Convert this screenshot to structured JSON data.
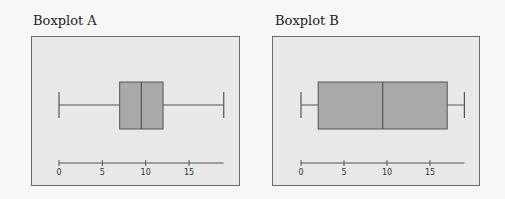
{
  "chart_data": [
    {
      "type": "boxplot",
      "title": "Boxplot A",
      "xlabel": "",
      "ylabel": "",
      "xlim": [
        0,
        19
      ],
      "ticks": [
        0,
        5,
        10,
        15
      ],
      "tick_labels": [
        "0",
        "5",
        "10",
        "15"
      ],
      "grid": false,
      "stats": {
        "min": 0,
        "q1": 7,
        "median": 9.5,
        "q3": 12,
        "max": 19
      }
    },
    {
      "type": "boxplot",
      "title": "Boxplot B",
      "xlabel": "",
      "ylabel": "",
      "xlim": [
        0,
        19
      ],
      "ticks": [
        0,
        5,
        10,
        15
      ],
      "tick_labels": [
        "0",
        "5",
        "10",
        "15"
      ],
      "grid": false,
      "stats": {
        "min": 0,
        "q1": 2,
        "median": 9.5,
        "q3": 17,
        "max": 19
      }
    }
  ],
  "colors": {
    "box_fill": "#a9a9a9",
    "panel_bg": "#e8e8e8",
    "stroke": "#555555"
  }
}
